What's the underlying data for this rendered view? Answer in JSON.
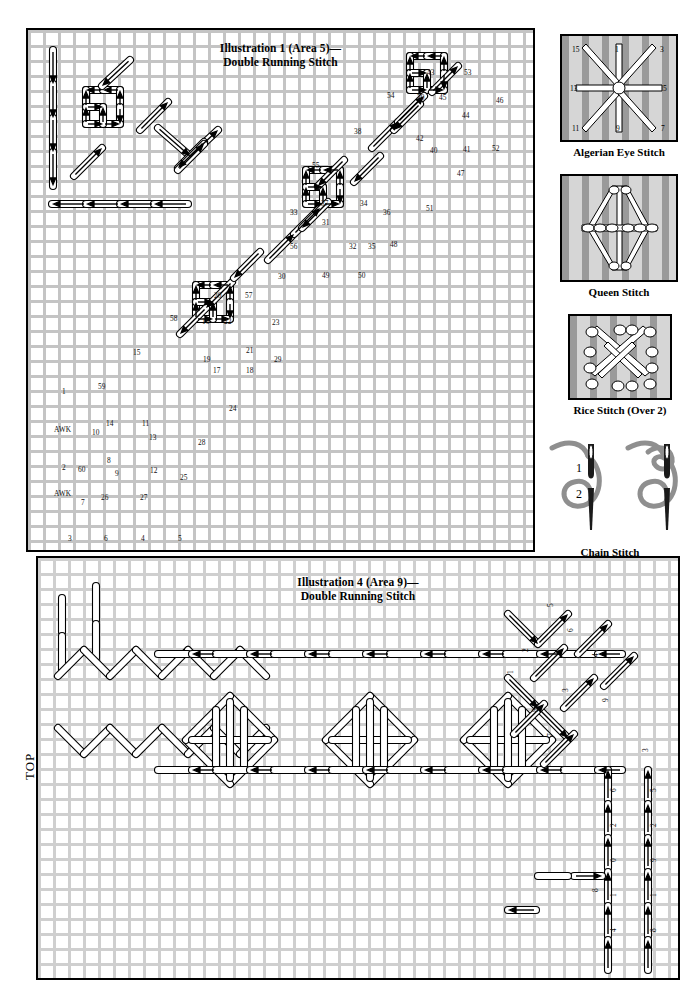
{
  "page": {
    "width": 687,
    "height": 987,
    "background": "#ffffff",
    "grid_color": "#c4c4c4",
    "ink_color": "#000000"
  },
  "illustration1": {
    "title_line1": "Illustration 1 (Area 5)—",
    "title_line2": "Double Running Stitch",
    "frame": {
      "x": 26,
      "y": 28,
      "width": 505,
      "height": 520
    },
    "stitch_labels": [
      {
        "text": "1",
        "x": 60,
        "y": 386
      },
      {
        "text": "AWK",
        "x": 52,
        "y": 424
      },
      {
        "text": "2",
        "x": 60,
        "y": 462
      },
      {
        "text": "AWK",
        "x": 52,
        "y": 488
      },
      {
        "text": "59",
        "x": 96,
        "y": 381
      },
      {
        "text": "10",
        "x": 90,
        "y": 427
      },
      {
        "text": "14",
        "x": 104,
        "y": 418
      },
      {
        "text": "11",
        "x": 140,
        "y": 418
      },
      {
        "text": "13",
        "x": 147,
        "y": 432
      },
      {
        "text": "60",
        "x": 76,
        "y": 464
      },
      {
        "text": "8",
        "x": 105,
        "y": 455
      },
      {
        "text": "9",
        "x": 113,
        "y": 468
      },
      {
        "text": "12",
        "x": 148,
        "y": 465
      },
      {
        "text": "25",
        "x": 178,
        "y": 472
      },
      {
        "text": "7",
        "x": 79,
        "y": 497
      },
      {
        "text": "26",
        "x": 99,
        "y": 492
      },
      {
        "text": "27",
        "x": 138,
        "y": 492
      },
      {
        "text": "3",
        "x": 66,
        "y": 533
      },
      {
        "text": "6",
        "x": 102,
        "y": 533
      },
      {
        "text": "4",
        "x": 139,
        "y": 533
      },
      {
        "text": "5",
        "x": 176,
        "y": 533
      },
      {
        "text": "28",
        "x": 196,
        "y": 437
      },
      {
        "text": "24",
        "x": 227,
        "y": 403
      },
      {
        "text": "15",
        "x": 131,
        "y": 347
      },
      {
        "text": "58",
        "x": 168,
        "y": 313
      },
      {
        "text": "20",
        "x": 212,
        "y": 290
      },
      {
        "text": "57",
        "x": 243,
        "y": 290
      },
      {
        "text": "16",
        "x": 200,
        "y": 316
      },
      {
        "text": "22",
        "x": 222,
        "y": 316
      },
      {
        "text": "23",
        "x": 270,
        "y": 317
      },
      {
        "text": "19",
        "x": 201,
        "y": 354
      },
      {
        "text": "21",
        "x": 244,
        "y": 345
      },
      {
        "text": "29",
        "x": 272,
        "y": 354
      },
      {
        "text": "17",
        "x": 211,
        "y": 365
      },
      {
        "text": "18",
        "x": 244,
        "y": 365
      },
      {
        "text": "30",
        "x": 276,
        "y": 271
      },
      {
        "text": "55",
        "x": 310,
        "y": 160
      },
      {
        "text": "37",
        "x": 319,
        "y": 198
      },
      {
        "text": "34",
        "x": 358,
        "y": 198
      },
      {
        "text": "33",
        "x": 288,
        "y": 207
      },
      {
        "text": "36",
        "x": 381,
        "y": 207
      },
      {
        "text": "31",
        "x": 320,
        "y": 217
      },
      {
        "text": "56",
        "x": 288,
        "y": 241
      },
      {
        "text": "32",
        "x": 347,
        "y": 241
      },
      {
        "text": "35",
        "x": 366,
        "y": 241
      },
      {
        "text": "48",
        "x": 388,
        "y": 239
      },
      {
        "text": "49",
        "x": 320,
        "y": 270
      },
      {
        "text": "50",
        "x": 356,
        "y": 270
      },
      {
        "text": "51",
        "x": 424,
        "y": 203
      },
      {
        "text": "38",
        "x": 352,
        "y": 126
      },
      {
        "text": "54",
        "x": 385,
        "y": 90
      },
      {
        "text": "43",
        "x": 425,
        "y": 67
      },
      {
        "text": "53",
        "x": 462,
        "y": 67
      },
      {
        "text": "39",
        "x": 415,
        "y": 92
      },
      {
        "text": "45",
        "x": 437,
        "y": 92
      },
      {
        "text": "46",
        "x": 494,
        "y": 95
      },
      {
        "text": "44",
        "x": 460,
        "y": 110
      },
      {
        "text": "42",
        "x": 414,
        "y": 133
      },
      {
        "text": "40",
        "x": 428,
        "y": 145
      },
      {
        "text": "41",
        "x": 461,
        "y": 144
      },
      {
        "text": "52",
        "x": 490,
        "y": 143
      },
      {
        "text": "47",
        "x": 455,
        "y": 168
      }
    ]
  },
  "illustration4": {
    "title_line1": "Illustration 4 (Area 9)—",
    "title_line2": "Double Running Stitch",
    "frame": {
      "x": 36,
      "y": 556,
      "width": 640,
      "height": 420
    },
    "top_label": "TOP",
    "stitch_labels": [
      {
        "text": "5",
        "x": 545,
        "y": 605
      },
      {
        "text": "6",
        "x": 565,
        "y": 630
      },
      {
        "text": "4",
        "x": 590,
        "y": 655
      },
      {
        "text": "2",
        "x": 520,
        "y": 650
      },
      {
        "text": "3",
        "x": 560,
        "y": 690
      },
      {
        "text": "1",
        "x": 505,
        "y": 672
      },
      {
        "text": "8",
        "x": 530,
        "y": 710
      },
      {
        "text": "7",
        "x": 545,
        "y": 735
      },
      {
        "text": "9",
        "x": 600,
        "y": 700
      },
      {
        "text": "3",
        "x": 640,
        "y": 750
      },
      {
        "text": "6",
        "x": 608,
        "y": 790
      },
      {
        "text": "5",
        "x": 648,
        "y": 790
      },
      {
        "text": "2",
        "x": 608,
        "y": 825
      },
      {
        "text": "2",
        "x": 648,
        "y": 825
      },
      {
        "text": "0",
        "x": 608,
        "y": 860
      },
      {
        "text": "9",
        "x": 648,
        "y": 860
      },
      {
        "text": "8",
        "x": 590,
        "y": 890
      },
      {
        "text": "1",
        "x": 608,
        "y": 895
      },
      {
        "text": "1",
        "x": 648,
        "y": 895
      },
      {
        "text": "4",
        "x": 608,
        "y": 930
      },
      {
        "text": "8",
        "x": 648,
        "y": 930
      }
    ]
  },
  "sidebar": {
    "items": [
      {
        "name": "algerian-eye-stitch",
        "caption": "Algerian Eye Stitch",
        "numbers": [
          "15",
          "1",
          "3",
          "13",
          "5",
          "11",
          "9",
          "7"
        ]
      },
      {
        "name": "queen-stitch",
        "caption": "Queen Stitch",
        "numbers": [
          "4",
          "2",
          "6",
          "8",
          "15",
          "16",
          "11",
          "12",
          "7",
          "8",
          "3",
          "1",
          "13",
          "5"
        ]
      },
      {
        "name": "rice-stitch",
        "caption": "Rice Stitch (Over 2)",
        "numbers": [
          "1",
          "8",
          "5",
          "4",
          "7",
          "6",
          "10",
          "11",
          "3",
          "9",
          "12",
          "2"
        ]
      },
      {
        "name": "chain-stitch",
        "caption": "Chain Stitch",
        "numbers": [
          "1",
          "2"
        ]
      }
    ]
  }
}
